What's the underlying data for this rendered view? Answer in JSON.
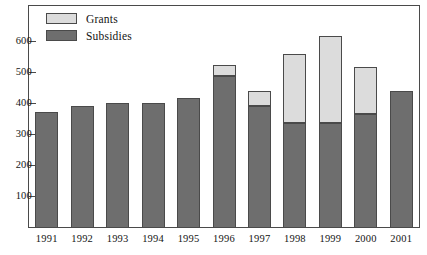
{
  "chart_data": {
    "type": "bar",
    "subtype": "stacked-bar",
    "title": "",
    "subtitle": "",
    "xlabel": "",
    "ylabel": "",
    "categories": [
      "1991",
      "1992",
      "1993",
      "1994",
      "1995",
      "1996",
      "1997",
      "1998",
      "1999",
      "2000",
      "2001"
    ],
    "series": [
      {
        "name": "Subsidies",
        "color": "#6e6e6e",
        "values": [
          375,
          395,
          403,
          403,
          420,
          490,
          393,
          340,
          340,
          367,
          441
        ]
      },
      {
        "name": "Grants",
        "color": "#dcdcdc",
        "values": [
          0,
          0,
          0,
          0,
          0,
          37,
          48,
          220,
          281,
          153,
          0
        ]
      }
    ],
    "totals": [
      375,
      395,
      403,
      403,
      420,
      527,
      441,
      560,
      621,
      520,
      441
    ],
    "ylim": [
      0,
      660
    ],
    "yticks": [
      100,
      200,
      300,
      400,
      500,
      600
    ],
    "ytick_labels": [
      "100",
      "200",
      "300",
      "400",
      "500",
      "600"
    ],
    "grid": false,
    "legend": {
      "position": "top-left",
      "entries": [
        {
          "label": "Grants",
          "color": "#dcdcdc"
        },
        {
          "label": "Subsidies",
          "color": "#6e6e6e"
        }
      ]
    },
    "frame": {
      "border_color": "#4a4a4a",
      "background": "#ffffff"
    }
  }
}
